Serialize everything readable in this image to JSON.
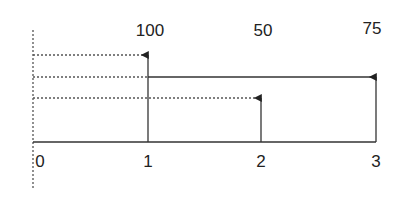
{
  "diagram": {
    "top_labels": [
      {
        "text": "100",
        "x": 150,
        "y": 22
      },
      {
        "text": "50",
        "x": 263,
        "y": 22
      },
      {
        "text": "75",
        "x": 372,
        "y": 20
      }
    ],
    "axis_labels": [
      {
        "text": "0",
        "x": 40,
        "y": 153
      },
      {
        "text": "1",
        "x": 148,
        "y": 153
      },
      {
        "text": "2",
        "x": 261,
        "y": 153
      },
      {
        "text": "3",
        "x": 376,
        "y": 153
      }
    ],
    "colors": {
      "line": "#333333",
      "dotted": "#555555"
    }
  }
}
